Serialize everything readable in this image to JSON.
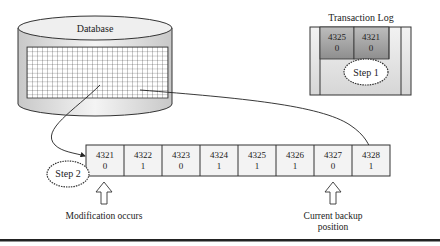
{
  "database": {
    "label": "Database"
  },
  "transaction_log": {
    "title": "Transaction Log",
    "entries": [
      {
        "page": "4325",
        "flag": "0"
      },
      {
        "page": "4321",
        "flag": "0"
      }
    ],
    "step_label": "Step 1"
  },
  "pages": [
    {
      "page": "4321",
      "flag": "0"
    },
    {
      "page": "4322",
      "flag": "1"
    },
    {
      "page": "4323",
      "flag": "0"
    },
    {
      "page": "4324",
      "flag": "1"
    },
    {
      "page": "4325",
      "flag": "1"
    },
    {
      "page": "4326",
      "flag": "1"
    },
    {
      "page": "4327",
      "flag": "0"
    },
    {
      "page": "4328",
      "flag": "1"
    }
  ],
  "step2_label": "Step 2",
  "modification_label": "Modification occurs",
  "backup_label_line1": "Current backup",
  "backup_label_line2": "position"
}
